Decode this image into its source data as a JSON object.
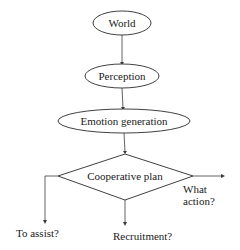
{
  "diagram": {
    "type": "flowchart",
    "nodes": [
      {
        "id": "world",
        "shape": "ellipse",
        "label": "World"
      },
      {
        "id": "perception",
        "shape": "ellipse",
        "label": "Perception"
      },
      {
        "id": "emotion",
        "shape": "ellipse",
        "label": "Emotion generation"
      },
      {
        "id": "coop",
        "shape": "diamond",
        "label": "Cooperative plan"
      }
    ],
    "edges": [
      {
        "from": "world",
        "to": "perception"
      },
      {
        "from": "perception",
        "to": "emotion"
      },
      {
        "from": "emotion",
        "to": "coop"
      },
      {
        "from": "coop",
        "to": "to_assist",
        "direction": "left-down"
      },
      {
        "from": "coop",
        "to": "recruitment",
        "direction": "down"
      },
      {
        "from": "coop",
        "to": "what_action",
        "direction": "right"
      }
    ],
    "outcomes": {
      "to_assist": "To assist?",
      "recruitment": "Recruitment?",
      "what_action_line1": "What",
      "what_action_line2": "action?"
    }
  }
}
